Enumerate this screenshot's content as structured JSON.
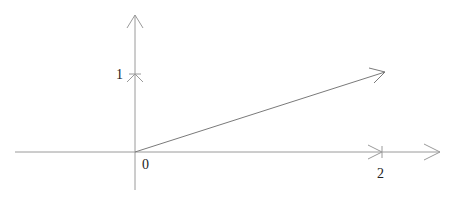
{
  "diagram": {
    "type": "vector-plot",
    "origin_label": "0",
    "x_tick_label": "2",
    "y_tick_label": "1",
    "colors": {
      "axis": "#8a8a8a",
      "vector": "#7a7a7a",
      "text": "#222222"
    },
    "vector": {
      "from": [
        0,
        0
      ],
      "to": [
        2,
        0.64
      ]
    }
  }
}
